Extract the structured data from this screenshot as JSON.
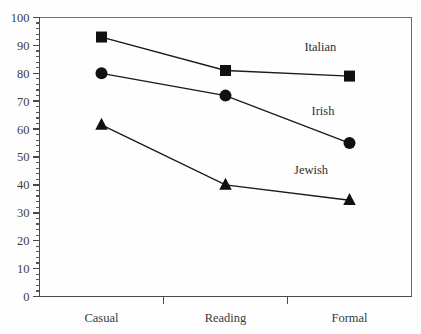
{
  "chart_data": {
    "type": "line",
    "title": "",
    "subtitle": "",
    "xlabel": "",
    "ylabel": "",
    "categories": [
      "Casual",
      "Reading",
      "Formal"
    ],
    "ylim": [
      0,
      100
    ],
    "xlim": [
      0,
      3
    ],
    "y_tick_step_major": 10,
    "y_tick_step_minor": 2,
    "y_ticks": [
      0,
      10,
      20,
      30,
      40,
      50,
      60,
      70,
      80,
      90,
      100
    ],
    "grid": false,
    "legend_position": "inline-annotations",
    "series": [
      {
        "name": "Italian",
        "marker": "square",
        "values": [
          93,
          81,
          79
        ],
        "label_text": "Italian"
      },
      {
        "name": "Irish",
        "marker": "circle",
        "values": [
          80,
          72,
          55
        ],
        "label_text": "Irish"
      },
      {
        "name": "Jewish",
        "marker": "triangle",
        "values": [
          61.5,
          40,
          34.5
        ],
        "label_text": "Jewish"
      }
    ],
    "annotations": [
      {
        "text": "Italian",
        "x_frac": 0.755,
        "y_value": 88
      },
      {
        "text": "Irish",
        "x_frac": 0.762,
        "y_value": 65
      },
      {
        "text": "Jewish",
        "x_frac": 0.73,
        "y_value": 44
      }
    ],
    "colors": {
      "ink": "#111111",
      "axis": "#4a4a4a",
      "frame": "#6e6e6e",
      "text": "#3a3a3a",
      "background": "#fefefe"
    }
  },
  "axis": {
    "y_labels": [
      "100",
      "90",
      "80",
      "70",
      "60",
      "50",
      "40",
      "30",
      "20",
      "10",
      "0"
    ],
    "x_labels": [
      "Casual",
      "Reading",
      "Formal"
    ]
  },
  "labels": {
    "italian": "Italian",
    "irish": "Irish",
    "jewish": "Jewish"
  }
}
